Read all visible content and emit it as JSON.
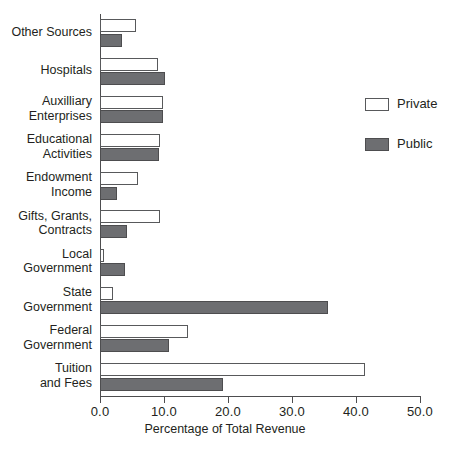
{
  "chart_data": {
    "type": "bar",
    "orientation": "horizontal",
    "title": "",
    "xlabel": "Percentage of Total Revenue",
    "ylabel": "",
    "xlim": [
      0.0,
      50.0
    ],
    "xticks": [
      "0.0",
      "10.0",
      "20.0",
      "30.0",
      "40.0",
      "50.0"
    ],
    "xtick_values": [
      0.0,
      10.0,
      20.0,
      30.0,
      40.0,
      50.0
    ],
    "grid": false,
    "legend_position": "right",
    "categories": [
      "Tuition and Fees",
      "Federal Government",
      "State Government",
      "Local Government",
      "Gifts, Grants, Contracts",
      "Endowment Income",
      "Educational Activities",
      "Auxilliary Enterprises",
      "Hospitals",
      "Other Sources"
    ],
    "category_lines": [
      [
        "Tuition",
        "and Fees"
      ],
      [
        "Federal",
        "Government"
      ],
      [
        "State",
        "Government"
      ],
      [
        "Local",
        "Government"
      ],
      [
        "Gifts, Grants,",
        "Contracts"
      ],
      [
        "Endowment",
        "Income"
      ],
      [
        "Educational",
        "Activities"
      ],
      [
        "Auxilliary",
        "Enterprises"
      ],
      [
        "Hospitals"
      ],
      [
        "Other Sources"
      ]
    ],
    "series": [
      {
        "name": "Private",
        "color": "#ffffff",
        "edge_color": "#58595b",
        "values": [
          41.4,
          13.7,
          2.0,
          0.7,
          9.4,
          5.9,
          9.4,
          9.8,
          9.1,
          5.6
        ]
      },
      {
        "name": "Public",
        "color": "#6d6e71",
        "edge_color": "#4d4d4f",
        "values": [
          19.2,
          10.8,
          35.6,
          3.9,
          4.2,
          2.6,
          9.2,
          9.8,
          10.1,
          3.4
        ]
      }
    ]
  },
  "legend": {
    "items": [
      {
        "label": "Private"
      },
      {
        "label": "Public"
      }
    ]
  }
}
